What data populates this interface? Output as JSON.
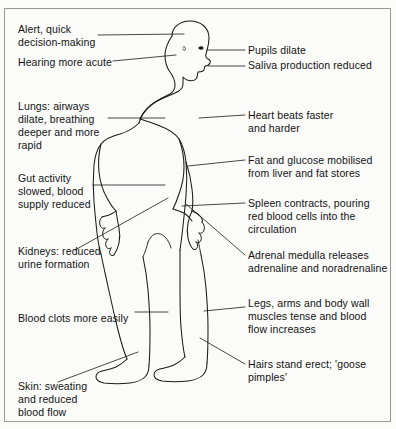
{
  "diagram": {
    "figure_name": "human-body-outline-profile",
    "frame_color": "#9a9a9a",
    "line_color": "#1a1a1a",
    "background_color": "#fbfbfa",
    "text_color": "#121212"
  },
  "labels": [
    {
      "id": "alert-decision-making",
      "name": "label-alert-decision-making",
      "lines": [
        "Alert, quick",
        "decision-making"
      ],
      "text": "Alert, quick\ndecision-making",
      "side": "left",
      "x": 18,
      "y": 23
    },
    {
      "id": "hearing-more-acute",
      "name": "label-hearing-more-acute",
      "lines": [
        "Hearing more acute"
      ],
      "text": "Hearing more acute",
      "side": "left",
      "x": 18,
      "y": 56
    },
    {
      "id": "lungs-airways-dilate",
      "name": "label-lungs-airways-dilate",
      "lines": [
        "Lungs: airways",
        "dilate, breathing",
        "deeper and more",
        "rapid"
      ],
      "text": "Lungs: airways\ndilate, breathing\ndeeper and more\nrapid",
      "side": "left",
      "x": 18,
      "y": 100
    },
    {
      "id": "gut-activity-slowed",
      "name": "label-gut-activity-slowed",
      "lines": [
        "Gut activity",
        "slowed, blood",
        "supply reduced"
      ],
      "text": "Gut activity\nslowed, blood\nsupply reduced",
      "side": "left",
      "x": 18,
      "y": 172
    },
    {
      "id": "kidneys-reduced-urine",
      "name": "label-kidneys-reduced-urine",
      "lines": [
        "Kidneys: reduced",
        "urine formation"
      ],
      "text": "Kidneys: reduced\nurine formation",
      "side": "left",
      "x": 18,
      "y": 245
    },
    {
      "id": "blood-clots-more-easily",
      "name": "label-blood-clots-more-easily",
      "lines": [
        "Blood clots more easily"
      ],
      "text": "Blood clots more easily",
      "side": "left",
      "x": 18,
      "y": 312
    },
    {
      "id": "skin-sweating",
      "name": "label-skin-sweating",
      "lines": [
        "Skin: sweating",
        "and reduced",
        "blood flow"
      ],
      "text": "Skin: sweating\nand reduced\nblood flow",
      "side": "left",
      "x": 18,
      "y": 380
    },
    {
      "id": "pupils-dilate",
      "name": "label-pupils-dilate",
      "lines": [
        "Pupils dilate"
      ],
      "text": "Pupils dilate",
      "side": "right",
      "x": 248,
      "y": 49
    },
    {
      "id": "saliva-production-reduced",
      "name": "label-saliva-production-reduced",
      "lines": [
        "Saliva production reduced"
      ],
      "text": "Saliva production reduced",
      "side": "right",
      "x": 248,
      "y": 62
    },
    {
      "id": "heart-beats-faster",
      "name": "label-heart-beats-faster",
      "lines": [
        "Heart beats faster",
        "and harder"
      ],
      "text": "Heart beats faster\nand harder",
      "side": "right",
      "x": 248,
      "y": 110
    },
    {
      "id": "fat-and-glucose-mobilised",
      "name": "label-fat-and-glucose-mobilised",
      "lines": [
        "Fat and glucose mobilised",
        "from liver and fat stores"
      ],
      "text": "Fat and glucose mobilised\nfrom liver and fat stores",
      "side": "right",
      "x": 248,
      "y": 155
    },
    {
      "id": "spleen-contracts",
      "name": "label-spleen-contracts",
      "lines": [
        "Spleen contracts, pouring",
        "red blood cells into the",
        "circulation"
      ],
      "text": "Spleen contracts, pouring\nred blood cells into the\ncirculation",
      "side": "right",
      "x": 248,
      "y": 198
    },
    {
      "id": "adrenal-medulla-releases",
      "name": "label-adrenal-medulla-releases",
      "lines": [
        "Adrenal medulla releases",
        "adrenaline and noradrenaline"
      ],
      "text": "Adrenal medulla releases\nadrenaline and noradrenaline",
      "side": "right",
      "x": 248,
      "y": 250
    },
    {
      "id": "legs-arms-body-wall",
      "name": "label-legs-arms-body-wall",
      "lines": [
        "Legs, arms and body wall",
        "muscles tense and blood",
        "flow increases"
      ],
      "text": "Legs, arms and body wall\nmuscles tense and blood\nflow increases",
      "side": "right",
      "x": 248,
      "y": 298
    },
    {
      "id": "hairs-stand-erect",
      "name": "label-hairs-stand-erect",
      "lines": [
        "Hairs stand erect; 'goose",
        "pimples'"
      ],
      "text": "Hairs stand erect; 'goose\npimples'",
      "side": "right",
      "x": 248,
      "y": 359
    }
  ]
}
